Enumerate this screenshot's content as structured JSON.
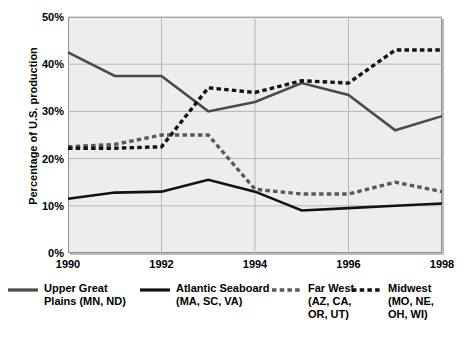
{
  "chart_data": {
    "type": "line",
    "title": "",
    "xlabel": "",
    "ylabel": "Percentage of U.S. production",
    "x": [
      1990,
      1991,
      1992,
      1993,
      1994,
      1995,
      1996,
      1997,
      1998
    ],
    "xtick_labels": [
      "1990",
      "1992",
      "1994",
      "1996",
      "1998"
    ],
    "xtick_values": [
      1990,
      1992,
      1994,
      1996,
      1998
    ],
    "ytick_labels": [
      "0%",
      "10%",
      "20%",
      "30%",
      "40%",
      "50%"
    ],
    "ytick_values": [
      0,
      10,
      20,
      30,
      40,
      50
    ],
    "ylim": [
      0,
      50
    ],
    "xlim": [
      1990,
      1998
    ],
    "grid": true,
    "legend_position": "bottom",
    "series": [
      {
        "name": "Upper Great Plains (MN, ND)",
        "style": "solid",
        "color": "#4a4a4a",
        "values": [
          42.5,
          37.5,
          37.5,
          30.0,
          32.0,
          36.0,
          33.5,
          26.0,
          29.0
        ]
      },
      {
        "name": "Atlantic Seaboard (MA, SC, VA)",
        "style": "solid",
        "color": "#111111",
        "values": [
          11.5,
          12.8,
          13.0,
          15.5,
          13.0,
          9.0,
          9.5,
          10.0,
          10.5
        ]
      },
      {
        "name": "Far West (AZ, CA, OR, UT)",
        "style": "dashed",
        "color": "#5a5a5a",
        "values": [
          22.5,
          23.0,
          25.0,
          25.0,
          13.5,
          12.5,
          12.5,
          15.0,
          13.0
        ]
      },
      {
        "name": "Midwest (MO, NE, OH, WI)",
        "style": "dashed",
        "color": "#111111",
        "values": [
          22.2,
          22.2,
          22.5,
          35.0,
          34.0,
          36.5,
          36.0,
          43.0,
          43.0
        ]
      }
    ]
  },
  "axis": {
    "ylabel": "Percentage of U.S. production",
    "yticks": [
      "50%",
      "40%",
      "30%",
      "20%",
      "10%",
      "0%"
    ],
    "xticks": [
      "1990",
      "1992",
      "1994",
      "1996",
      "1998"
    ]
  },
  "legend": {
    "items": [
      {
        "label": "Upper Great\nPlains (MN, ND)",
        "style": "solid",
        "color": "#4a4a4a"
      },
      {
        "label": "Atlantic Seaboard\n(MA, SC, VA)",
        "style": "solid",
        "color": "#111111"
      },
      {
        "label": "Far West\n(AZ, CA,\nOR, UT)",
        "style": "dashed",
        "color": "#5a5a5a"
      },
      {
        "label": "Midwest\n(MO, NE,\nOH, WI)",
        "style": "dashed",
        "color": "#111111"
      }
    ]
  },
  "footnote": {
    "text": ""
  }
}
